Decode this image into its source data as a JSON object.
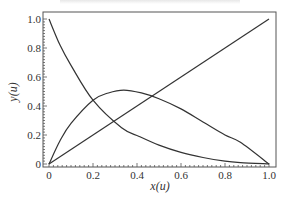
{
  "chart_data": {
    "type": "line",
    "title": "",
    "xlabel": "x(u)",
    "ylabel": "y(u)",
    "xlim": [
      0,
      1.0
    ],
    "ylim": [
      0,
      1.0
    ],
    "grid": false,
    "legend": null,
    "x_ticks": [
      "0",
      "0.2",
      "0.4",
      "0.6",
      "0.8",
      "1.0"
    ],
    "y_ticks": [
      "0",
      "0.2",
      "0.4",
      "0.6",
      "0.8",
      "1.0"
    ],
    "series": [
      {
        "name": "decreasing-curve",
        "x": [
          0.0,
          0.05,
          0.1,
          0.2,
          0.33,
          0.41,
          0.5,
          0.6,
          0.7,
          0.8,
          0.87,
          1.0
        ],
        "y": [
          1.0,
          0.82,
          0.68,
          0.44,
          0.25,
          0.19,
          0.13,
          0.08,
          0.045,
          0.02,
          0.01,
          0.0
        ]
      },
      {
        "name": "hump-curve",
        "x": [
          0.0,
          0.05,
          0.1,
          0.2,
          0.27,
          0.34,
          0.42,
          0.5,
          0.6,
          0.7,
          0.8,
          0.87,
          1.0
        ],
        "y": [
          0.0,
          0.16,
          0.28,
          0.44,
          0.49,
          0.51,
          0.49,
          0.45,
          0.38,
          0.29,
          0.2,
          0.15,
          0.0
        ]
      },
      {
        "name": "diagonal-line",
        "x": [
          0.0,
          1.0
        ],
        "y": [
          0.0,
          1.0
        ]
      }
    ]
  },
  "labels": {
    "x_axis": "x(u)",
    "y_axis": "y(u)"
  }
}
